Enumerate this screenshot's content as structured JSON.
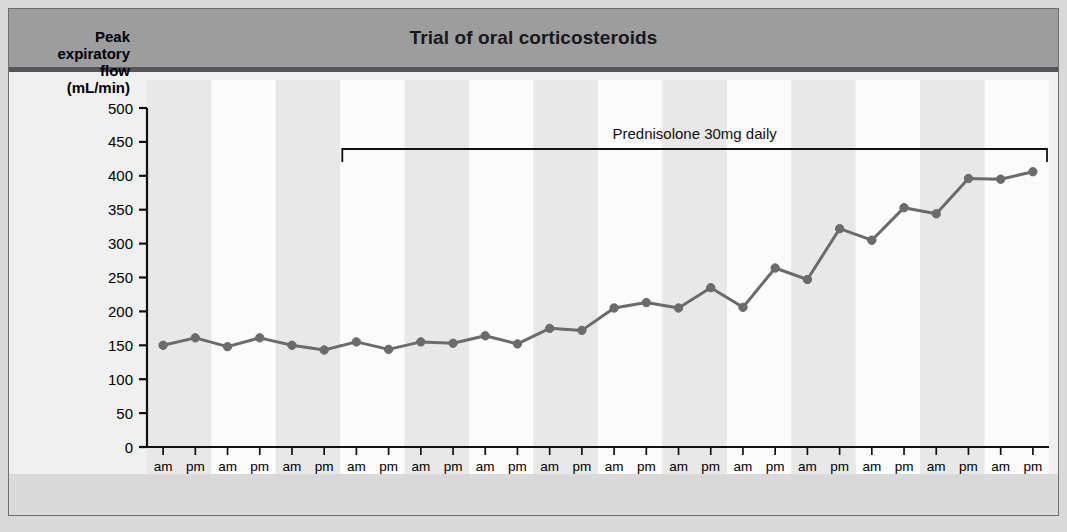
{
  "figure": {
    "title": "Trial of oral corticosteroids",
    "banner_color": "#9d9d9d",
    "rule_color": "#55555a",
    "plate_color": "#d9d9d9"
  },
  "axis": {
    "y_label_lines": [
      "Peak",
      "expiratory",
      "flow",
      "(mL/min)"
    ],
    "y_ticks": [
      "0",
      "50",
      "100",
      "150",
      "200",
      "250",
      "300",
      "350",
      "400",
      "450",
      "500"
    ]
  },
  "annotation": {
    "text": "Prednisolone 30mg daily",
    "bracket_start_index": 6,
    "bracket_end_index": 27
  },
  "chart_data": {
    "type": "line",
    "title": "Trial of oral corticosteroids",
    "xlabel": "",
    "ylabel": "Peak expiratory flow (mL/min)",
    "ylim": [
      0,
      500
    ],
    "ytick_step": 50,
    "grid": false,
    "legend": "none",
    "line_color": "#6b6b6b",
    "marker_color": "#6b6b6b",
    "band_color_a": "#e8e8e8",
    "band_color_b": "#fbfbfb",
    "days": [
      "Mon",
      "Tue",
      "Wed",
      "Thu",
      "Fri",
      "Sat",
      "Sun",
      "Mon",
      "Tue",
      "Wed",
      "Thu",
      "Fri",
      "Sat",
      "Sun"
    ],
    "times": [
      "am",
      "pm"
    ],
    "x": [
      "Mon am",
      "Mon pm",
      "Tue am",
      "Tue pm",
      "Wed am",
      "Wed pm",
      "Thu am",
      "Thu pm",
      "Fri am",
      "Fri pm",
      "Sat am",
      "Sat pm",
      "Sun am",
      "Sun pm",
      "Mon am",
      "Mon pm",
      "Tue am",
      "Tue pm",
      "Wed am",
      "Wed pm",
      "Thu am",
      "Thu pm",
      "Fri am",
      "Fri pm",
      "Sat am",
      "Sat pm",
      "Sun am",
      "Sun pm"
    ],
    "values": [
      150,
      161,
      148,
      161,
      150,
      143,
      155,
      144,
      155,
      153,
      164,
      152,
      175,
      172,
      205,
      213,
      205,
      235,
      206,
      264,
      247,
      322,
      305,
      353,
      344,
      396,
      395,
      406
    ],
    "series": [
      {
        "name": "Peak expiratory flow",
        "values": [
          150,
          161,
          148,
          161,
          150,
          143,
          155,
          144,
          155,
          153,
          164,
          152,
          175,
          172,
          205,
          213,
          205,
          235,
          206,
          264,
          247,
          322,
          305,
          353,
          344,
          396,
          395,
          406
        ]
      }
    ]
  }
}
